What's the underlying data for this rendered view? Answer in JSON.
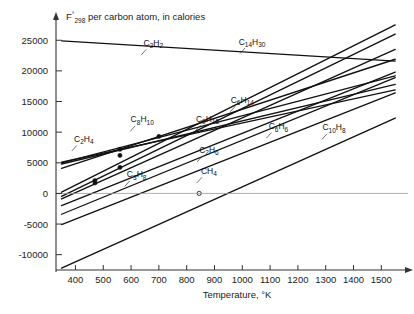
{
  "chart_data": {
    "type": "line",
    "title": "F°298 per carbon atom, in calories",
    "title_main": "F",
    "title_sup": "°",
    "title_sub": "298",
    "title_rest": " per carbon atom, in calories",
    "xlabel": "Temperature, °K",
    "ylabel": "F°298 per carbon atom, in calories",
    "xlim": [
      330,
      1560
    ],
    "ylim": [
      -12500,
      27000
    ],
    "xticks": [
      400,
      500,
      600,
      700,
      800,
      900,
      1000,
      1100,
      1200,
      1300,
      1400,
      1500
    ],
    "yticks": [
      25000,
      20000,
      15000,
      10000,
      5000,
      0,
      -5000,
      -10000
    ],
    "xtick_labels": [
      "400",
      "500",
      "600",
      "700",
      "800",
      "900",
      "1000",
      "1100",
      "1200",
      "1300",
      "1400",
      "1500"
    ],
    "ytick_labels": [
      "25000",
      "20000",
      "15000",
      "10000",
      "5000",
      "0",
      "-5000",
      "-10000"
    ],
    "grid": false,
    "legend": "inline-labels",
    "zero_line": true,
    "series": [
      {
        "name": "C2H2",
        "label_main": "C",
        "label_sub1": "2",
        "label_mid": "H",
        "label_sub2": "2",
        "points": [
          [
            350,
            24900
          ],
          [
            1550,
            21600
          ]
        ],
        "label_x": 680,
        "label_y": 24100,
        "markers": []
      },
      {
        "name": "C14H30",
        "label_main": "C",
        "label_sub1": "14",
        "label_mid": "H",
        "label_sub2": "30",
        "points": [
          [
            350,
            200
          ],
          [
            1550,
            27500
          ]
        ],
        "label_x": 1035,
        "label_y": 24300,
        "markers": []
      },
      {
        "name": "C9H18",
        "label_main": "C",
        "label_sub1": "9",
        "label_mid": "H",
        "label_sub2": "18",
        "points": [
          [
            350,
            -500
          ],
          [
            1550,
            26000
          ]
        ],
        "label_x": 875,
        "label_y": 11700,
        "markers": [
          [
            470,
            2100
          ],
          [
            560,
            4250
          ]
        ]
      },
      {
        "name": "C8H10",
        "label_main": "C",
        "label_sub1": "8",
        "label_mid": "H",
        "label_sub2": "10",
        "points": [
          [
            350,
            4100
          ],
          [
            1550,
            21900
          ]
        ],
        "label_x": 640,
        "label_y": 11600,
        "markers": [
          [
            560,
            7200
          ],
          [
            700,
            9300
          ]
        ]
      },
      {
        "name": "C6H14",
        "label_main": "C",
        "label_sub1": "6",
        "label_mid": "H",
        "label_sub2": "14",
        "points": [
          [
            350,
            -900
          ],
          [
            1550,
            23500
          ]
        ],
        "label_x": 1000,
        "label_y": 14800,
        "markers": [
          [
            470,
            1700
          ]
        ]
      },
      {
        "name": "C6H6",
        "label_main": "C",
        "label_sub1": "6",
        "label_mid": "H",
        "label_sub2": "6",
        "points": [
          [
            350,
            4800
          ],
          [
            1550,
            17800
          ]
        ],
        "label_x": 1130,
        "label_y": 10500,
        "markers": [
          [
            560,
            6200
          ]
        ]
      },
      {
        "name": "C10H8",
        "label_main": "C",
        "label_sub1": "10",
        "label_mid": "H",
        "label_sub2": "8",
        "points": [
          [
            350,
            5000
          ],
          [
            1550,
            19200
          ]
        ],
        "label_x": 1330,
        "label_y": 10300,
        "markers": []
      },
      {
        "name": "C2H4",
        "label_main": "C",
        "label_sub1": "2",
        "label_mid": "H",
        "label_sub2": "4",
        "points": [
          [
            350,
            5100
          ],
          [
            1550,
            16900
          ]
        ],
        "label_x": 430,
        "label_y": 8400,
        "markers": []
      },
      {
        "name": "C2H6",
        "label_main": "C",
        "label_sub1": "2",
        "label_mid": "H",
        "label_sub2": "6",
        "points": [
          [
            350,
            -2000
          ],
          [
            1550,
            19800
          ]
        ],
        "label_x": 880,
        "label_y": 6600,
        "markers": []
      },
      {
        "name": "C3H8",
        "label_main": "C",
        "label_sub1": "3",
        "label_mid": "H",
        "label_sub2": "8",
        "points": [
          [
            350,
            -3400
          ],
          [
            1550,
            18900
          ]
        ],
        "label_x": 620,
        "label_y": 2600,
        "markers": []
      },
      {
        "name": "CH4",
        "label_main": "C",
        "label_sub1": "",
        "label_mid": "H",
        "label_sub2": "4",
        "points": [
          [
            350,
            -5100
          ],
          [
            1550,
            16400
          ]
        ],
        "label_x": 880,
        "label_y": 3200,
        "markers": [
          [
            845,
            0
          ]
        ]
      },
      {
        "name": "lowest-line",
        "label_main": "",
        "label_sub1": "",
        "label_mid": "",
        "label_sub2": "",
        "points": [
          [
            350,
            -12200
          ],
          [
            1550,
            12300
          ]
        ],
        "label_x": 0,
        "label_y": 0,
        "markers": []
      }
    ],
    "annotations": [
      {
        "text": "C2H2 curve nearly horizontal, slight negative slope"
      },
      {
        "text": "CH4 crosses zero free energy near 845 K"
      }
    ]
  },
  "axes": {
    "x_axis_name": "temperature-axis",
    "y_axis_name": "free-energy-axis",
    "arrow_x": true,
    "arrow_y": true
  }
}
